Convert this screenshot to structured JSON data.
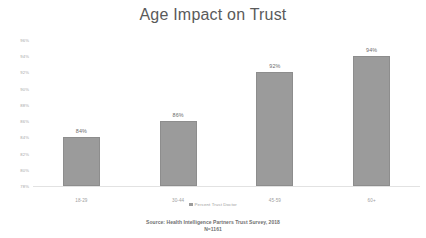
{
  "chart_data": {
    "type": "bar",
    "title": "Age Impact on Trust",
    "categories": [
      "18-29",
      "30-44",
      "45-59",
      "60+"
    ],
    "values": [
      84,
      86,
      92,
      94
    ],
    "value_labels": [
      "84%",
      "86%",
      "92%",
      "94%"
    ],
    "series": [
      {
        "name": "Percent Trust Doctor",
        "values": [
          84,
          86,
          92,
          94
        ],
        "color": "#9b9b9b"
      }
    ],
    "xlabel": "",
    "ylabel": "",
    "ylim": [
      78,
      96
    ],
    "ytick_labels": [
      "96%",
      "94%",
      "92%",
      "90%",
      "88%",
      "86%",
      "84%",
      "82%",
      "80%",
      "78%"
    ],
    "ytick_values": [
      96,
      94,
      92,
      90,
      88,
      86,
      84,
      82,
      80,
      78
    ],
    "grid": false,
    "legend_position": "bottom",
    "legend_entries": [
      "Percent Trust Doctor"
    ],
    "annotations": [
      "Source: Health Intelligence Partners Trust Survey, 2018",
      "N=1161"
    ]
  },
  "legend": {
    "label": "Percent Trust Doctor",
    "swatch_color": "#9b9b9b"
  },
  "source": {
    "line1": "Source: Health Intelligence Partners Trust Survey, 2018",
    "line2": "N=1161"
  },
  "colors": {
    "bar": "#9b9b9b",
    "title_text": "#5a5a5a",
    "tick_text": "#a6a6a6",
    "background": "#ffffff"
  }
}
